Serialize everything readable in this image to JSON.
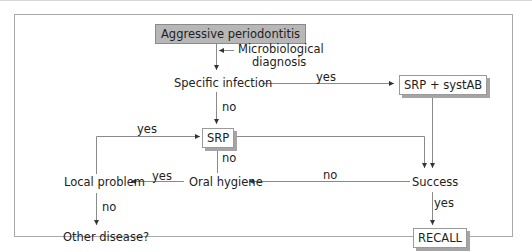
{
  "diagram": {
    "type": "flowchart",
    "nodes": {
      "start": "Aggressive periodontitis",
      "micro": "Microbiological diagnosis",
      "micro_line1": "Microbiological",
      "micro_line2": "diagnosis",
      "specific": "Specific infection",
      "srp_syst": "SRP + systAB",
      "srp": "SRP",
      "success": "Success",
      "oral": "Oral hygiene",
      "local": "Local problem",
      "other": "Other disease?",
      "recall": "RECALL"
    },
    "edge_labels": {
      "specific_yes": "yes",
      "specific_no": "no",
      "local_yes_to_srp": "yes",
      "oral_no": "no",
      "oral_yes": "yes",
      "success_no": "no",
      "success_yes": "yes",
      "local_no": "no"
    },
    "edges": [
      {
        "from": "Aggressive periodontitis",
        "to": "Specific infection"
      },
      {
        "from": "Microbiological diagnosis",
        "to": "Aggressive periodontitis → Specific infection line"
      },
      {
        "from": "Specific infection",
        "to": "SRP + systAB",
        "label": "yes"
      },
      {
        "from": "Specific infection",
        "to": "SRP",
        "label": "no"
      },
      {
        "from": "SRP + systAB",
        "to": "Success"
      },
      {
        "from": "SRP",
        "to": "Success"
      },
      {
        "from": "Success",
        "to": "Oral hygiene",
        "label": "no"
      },
      {
        "from": "Success",
        "to": "RECALL",
        "label": "yes"
      },
      {
        "from": "Oral hygiene",
        "to": "SRP",
        "label": "no"
      },
      {
        "from": "Oral hygiene",
        "to": "Local problem",
        "label": "yes"
      },
      {
        "from": "Local problem",
        "to": "SRP",
        "label": "yes"
      },
      {
        "from": "Local problem",
        "to": "Other disease?",
        "label": "no"
      }
    ],
    "colors": {
      "start_fill": "#b7b7b7",
      "shadow": "#a5a5a5",
      "line": "#7a7a7a",
      "frame": "#a9a9a9"
    }
  }
}
